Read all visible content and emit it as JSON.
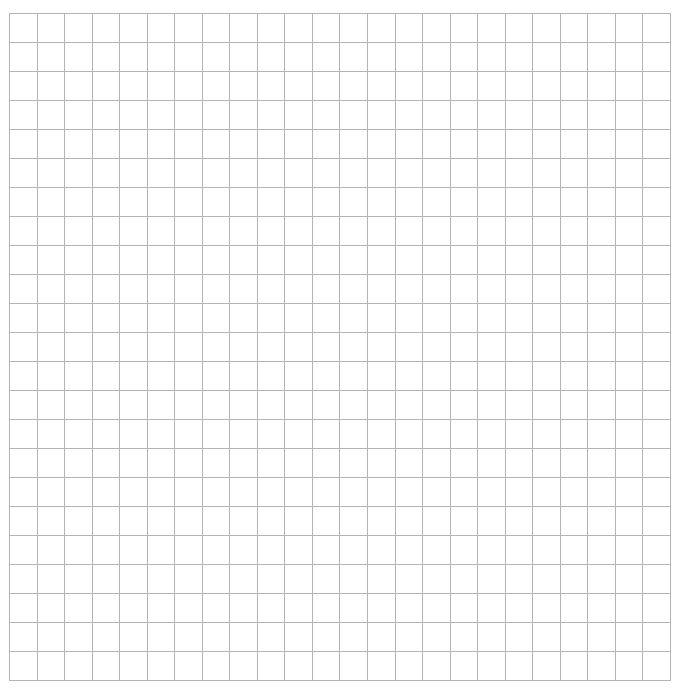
{
  "grid": {
    "columns": 24,
    "rows": 23,
    "cell_width": 27.54,
    "cell_height": 29,
    "line_color": "#b4b4b4",
    "background": "#ffffff"
  }
}
